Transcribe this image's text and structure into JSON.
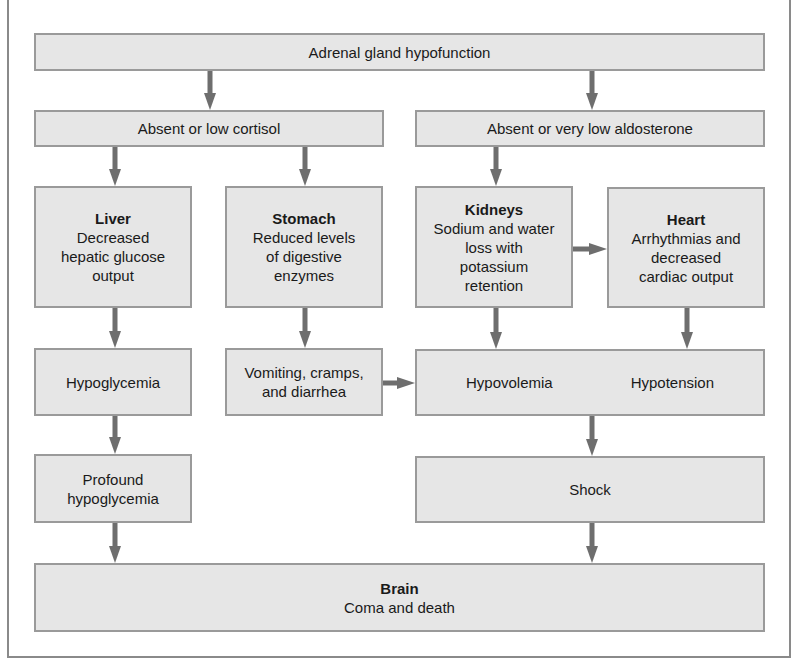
{
  "diagram": {
    "colors": {
      "box_fill": "#e6e6e6",
      "box_border": "#9a9a9a",
      "arrow": "#6e6e6e",
      "frame": "#8a8a8a",
      "text": "#1a1a1a"
    },
    "nodes": {
      "adrenal": {
        "label": "Adrenal gland hypofunction"
      },
      "cortisol": {
        "label": "Absent or low cortisol"
      },
      "aldosterone": {
        "label": "Absent or very low aldosterone"
      },
      "liver": {
        "title": "Liver",
        "line1": "Decreased",
        "line2": "hepatic glucose",
        "line3": "output"
      },
      "stomach": {
        "title": "Stomach",
        "line1": "Reduced levels",
        "line2": "of digestive",
        "line3": "enzymes"
      },
      "kidneys": {
        "title": "Kidneys",
        "line1": "Sodium and water",
        "line2": "loss with",
        "line3": "potassium",
        "line4": "retention"
      },
      "heart": {
        "title": "Heart",
        "line1": "Arrhythmias and",
        "line2": "decreased",
        "line3": "cardiac output"
      },
      "hypoglycemia": {
        "label": "Hypoglycemia"
      },
      "vomiting": {
        "line1": "Vomiting, cramps,",
        "line2": "and diarrhea"
      },
      "hypo_combined": {
        "left": "Hypovolemia",
        "right": "Hypotension"
      },
      "profound": {
        "line1": "Profound",
        "line2": "hypoglycemia"
      },
      "shock": {
        "label": "Shock"
      },
      "brain": {
        "title": "Brain",
        "line1": "Coma and death"
      }
    },
    "edges": [
      {
        "from": "adrenal",
        "to": "cortisol"
      },
      {
        "from": "adrenal",
        "to": "aldosterone"
      },
      {
        "from": "cortisol",
        "to": "liver"
      },
      {
        "from": "cortisol",
        "to": "stomach"
      },
      {
        "from": "aldosterone",
        "to": "kidneys"
      },
      {
        "from": "kidneys",
        "to": "heart"
      },
      {
        "from": "liver",
        "to": "hypoglycemia"
      },
      {
        "from": "stomach",
        "to": "vomiting"
      },
      {
        "from": "kidneys",
        "to": "hypovolemia"
      },
      {
        "from": "heart",
        "to": "hypotension"
      },
      {
        "from": "vomiting",
        "to": "hypovolemia"
      },
      {
        "from": "hypoglycemia",
        "to": "profound"
      },
      {
        "from": "hypo_combined",
        "to": "shock"
      },
      {
        "from": "profound",
        "to": "brain"
      },
      {
        "from": "shock",
        "to": "brain"
      }
    ]
  }
}
